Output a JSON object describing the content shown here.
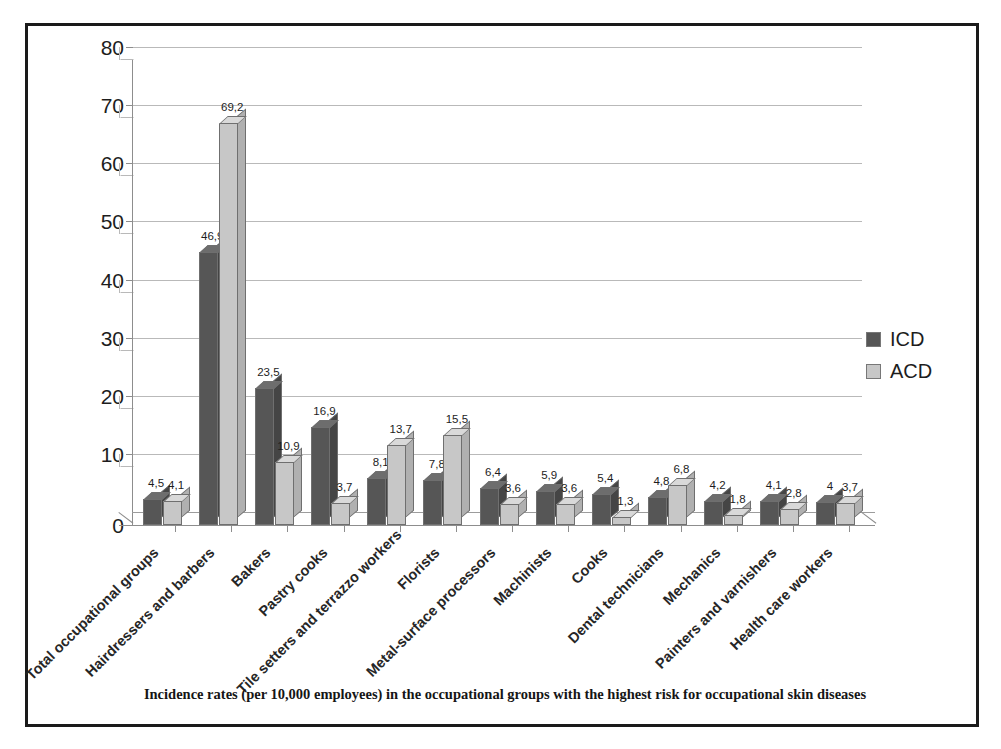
{
  "caption": "Incidence rates (per 10,000 employees) in the occupational groups with the highest risk for occupational skin diseases",
  "legend": {
    "items": [
      {
        "label": "ICD",
        "color": "#565656"
      },
      {
        "label": "ACD",
        "color": "#c7c7c7"
      }
    ]
  },
  "colors": {
    "icd": "#565656",
    "acd": "#c7c7c7",
    "frame": "#1a1a1a",
    "gridline": "#b9b9b9",
    "axis": "#8d8d8d"
  },
  "chart_data": {
    "type": "bar",
    "title": "",
    "subtitle": "",
    "xlabel": "",
    "ylabel": "",
    "ylim": [
      0,
      80
    ],
    "yticks": [
      0,
      10,
      20,
      30,
      40,
      50,
      60,
      70,
      80
    ],
    "ytick_labels": [
      "0",
      "10",
      "20",
      "30",
      "40",
      "50",
      "60",
      "70",
      "80"
    ],
    "grid": true,
    "legend_position": "right",
    "decimal_separator": ",",
    "categories": [
      "Total occupational groups",
      "Hairdressers and barbers",
      "Bakers",
      "Pastry cooks",
      "Tile setters and terrazzo workers",
      "Florists",
      "Metal-surface processors",
      "Machinists",
      "Cooks",
      "Dental technicians",
      "Mechanics",
      "Painters and varnishers",
      "Health care workers"
    ],
    "series": [
      {
        "name": "ICD",
        "values": [
          4.5,
          46.9,
          23.5,
          16.9,
          8.1,
          7.8,
          6.4,
          5.9,
          5.4,
          4.8,
          4.2,
          4.1,
          4
        ],
        "labels": [
          "4,5",
          "46,9",
          "23,5",
          "16,9",
          "8,1",
          "7,8",
          "6,4",
          "5,9",
          "5,4",
          "4,8",
          "4,2",
          "4,1",
          "4"
        ]
      },
      {
        "name": "ACD",
        "values": [
          4.1,
          69.2,
          10.9,
          3.7,
          13.7,
          15.5,
          3.6,
          3.6,
          1.3,
          6.8,
          1.8,
          2.8,
          3.7
        ],
        "labels": [
          "4,1",
          "69,2",
          "10,9",
          "3,7",
          "13,7",
          "15,5",
          "3,6",
          "3,6",
          "1,3",
          "6,8",
          "1,8",
          "2,8",
          "3,7"
        ]
      }
    ]
  }
}
